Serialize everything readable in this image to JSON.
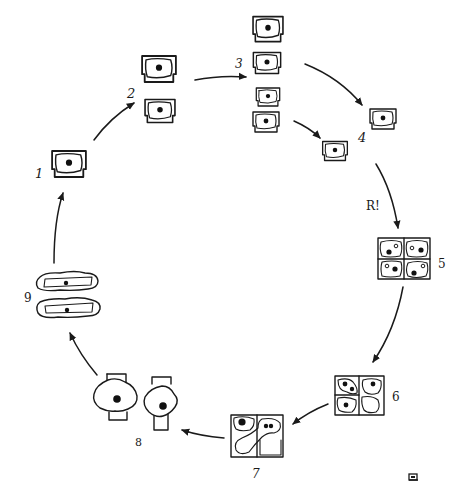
{
  "diagram": {
    "type": "cycle",
    "stages": [
      {
        "id": 1,
        "label": "1",
        "cells": 1,
        "shape": "rectangular cell with inner wavy membrane and central nucleus"
      },
      {
        "id": 2,
        "label": "2",
        "cells": 2,
        "shape": "two stacked rectangular cells with central nucleus"
      },
      {
        "id": 3,
        "label": "3",
        "cells": 4,
        "shape": "four stacked rectangular cells in two pairs"
      },
      {
        "id": 4,
        "label": "4",
        "cells": 2,
        "shape": "two separate rectangular cells"
      },
      {
        "id": 5,
        "label": "5",
        "cells": 4,
        "shape": "2x2 block of square cells, each with dark nucleus and small hollow nucleolus"
      },
      {
        "id": 6,
        "label": "6",
        "cells": 4,
        "shape": "2x2 block with fusing protoplasts and nuclei migrating"
      },
      {
        "id": 7,
        "label": "7",
        "cells": 4,
        "shape": "2x2 block with fused elongated protoplast containing two nuclei; one large dark nucleus"
      },
      {
        "id": 8,
        "label": "8",
        "cells": 2,
        "shape": "two cross/lobed shaped cells with large central nucleus"
      },
      {
        "id": 9,
        "label": "9",
        "cells": 2,
        "shape": "two elongated horizontal cells with wavy outer envelope and central nucleus"
      }
    ],
    "annotations": [
      {
        "text": "R!",
        "position": "between stage 4 and stage 5"
      }
    ],
    "arrows": [
      {
        "from": "1",
        "to": "2"
      },
      {
        "from": "2",
        "to": "3"
      },
      {
        "from": "3",
        "to": "4",
        "note": "upper pair"
      },
      {
        "from": "3",
        "to": "4",
        "note": "lower pair"
      },
      {
        "from": "4",
        "to": "5"
      },
      {
        "from": "5",
        "to": "6"
      },
      {
        "from": "6",
        "to": "7"
      },
      {
        "from": "7",
        "to": "8"
      },
      {
        "from": "8",
        "to": "9"
      },
      {
        "from": "9",
        "to": "1"
      }
    ],
    "corner_mark": {
      "glyph": "▣",
      "position": "bottom-right"
    }
  },
  "labels": {
    "s1": "1",
    "s2": "2",
    "s3": "3",
    "s4": "4",
    "s5": "5",
    "s6": "6",
    "s7": "7",
    "s8": "8",
    "s9": "9",
    "r": "R!",
    "corner": "▣"
  }
}
